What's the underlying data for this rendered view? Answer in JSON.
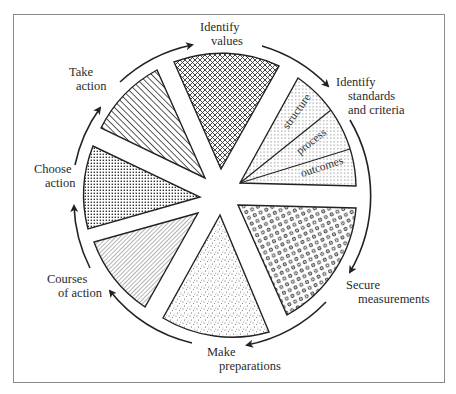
{
  "diagram": {
    "title": "",
    "type": "cyclic-process-wheel",
    "steps": [
      {
        "id": "identify-values",
        "lines": [
          "Identify",
          "values"
        ],
        "pattern": "crosshatch"
      },
      {
        "id": "identify-standards",
        "lines": [
          "Identify",
          "standards",
          "and criteria"
        ],
        "pattern": "fine-dots",
        "subsections": [
          "structure",
          "process",
          "outcomes"
        ]
      },
      {
        "id": "secure-measurements",
        "lines": [
          "Secure",
          "measurements"
        ],
        "pattern": "open-circles"
      },
      {
        "id": "make-preparations",
        "lines": [
          "Make",
          "preparations"
        ],
        "pattern": "stipple"
      },
      {
        "id": "courses-of-action",
        "lines": [
          "Courses",
          "of action"
        ],
        "pattern": "fine-diagonal-lines"
      },
      {
        "id": "choose-action",
        "lines": [
          "Choose",
          "action"
        ],
        "pattern": "dense-grid-dots"
      },
      {
        "id": "take-action",
        "lines": [
          "Take",
          "action"
        ],
        "pattern": "bold-diagonal-lines"
      }
    ],
    "flow_direction": "clockwise",
    "colors": {
      "ink": "#222222",
      "frame": "#8a8a8a",
      "background": "#ffffff"
    }
  }
}
